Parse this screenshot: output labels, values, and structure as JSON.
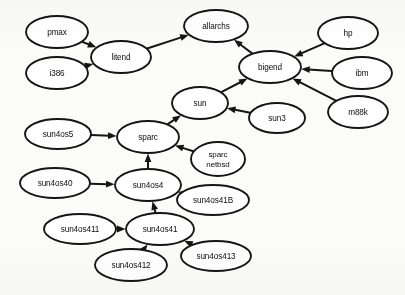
{
  "diagram": {
    "type": "directed-graph",
    "background_color": "#fbfbfa",
    "node_fill": "#ffffff",
    "node_stroke": "#151515",
    "edge_color": "#151515",
    "nodes": [
      {
        "id": "pmax",
        "label": "pmax",
        "cx": 57,
        "cy": 32,
        "rx": 31,
        "ry": 16
      },
      {
        "id": "i386",
        "label": "i386",
        "cx": 57,
        "cy": 73,
        "rx": 31,
        "ry": 16
      },
      {
        "id": "litend",
        "label": "litend",
        "cx": 121,
        "cy": 57,
        "rx": 30,
        "ry": 16
      },
      {
        "id": "allarchs",
        "label": "allarchs",
        "cx": 216,
        "cy": 26,
        "rx": 32,
        "ry": 16
      },
      {
        "id": "bigend",
        "label": "bigend",
        "cx": 270,
        "cy": 67,
        "rx": 31,
        "ry": 16
      },
      {
        "id": "hp",
        "label": "hp",
        "cx": 348,
        "cy": 33,
        "rx": 30,
        "ry": 16
      },
      {
        "id": "ibm",
        "label": "ibm",
        "cx": 362,
        "cy": 73,
        "rx": 30,
        "ry": 16
      },
      {
        "id": "m88k",
        "label": "m88k",
        "cx": 358,
        "cy": 112,
        "rx": 30,
        "ry": 16
      },
      {
        "id": "sun",
        "label": "sun",
        "cx": 200,
        "cy": 103,
        "rx": 28,
        "ry": 16
      },
      {
        "id": "sun3",
        "label": "sun3",
        "cx": 277,
        "cy": 118,
        "rx": 28,
        "ry": 15
      },
      {
        "id": "sparc",
        "label": "sparc",
        "cx": 148,
        "cy": 137,
        "rx": 31,
        "ry": 16
      },
      {
        "id": "sun4os5",
        "label": "sun4os5",
        "cx": 58,
        "cy": 134,
        "rx": 33,
        "ry": 15
      },
      {
        "id": "sparcnetbsd",
        "label": "sparc\nnetbsd",
        "cx": 218,
        "cy": 159,
        "rx": 27,
        "ry": 17
      },
      {
        "id": "sun4os4",
        "label": "sun4os4",
        "cx": 148,
        "cy": 185,
        "rx": 33,
        "ry": 16
      },
      {
        "id": "sun4os40",
        "label": "sun4os40",
        "cx": 55,
        "cy": 183,
        "rx": 35,
        "ry": 15
      },
      {
        "id": "sun4os41B",
        "label": "sun4os41B",
        "cx": 213,
        "cy": 200,
        "rx": 36,
        "ry": 15
      },
      {
        "id": "sun4os41",
        "label": "sun4os41",
        "cx": 160,
        "cy": 229,
        "rx": 34,
        "ry": 16
      },
      {
        "id": "sun4os411",
        "label": "sun4os411",
        "cx": 80,
        "cy": 229,
        "rx": 36,
        "ry": 15
      },
      {
        "id": "sun4os412",
        "label": "sun4os412",
        "cx": 131,
        "cy": 265,
        "rx": 36,
        "ry": 16
      },
      {
        "id": "sun4os413",
        "label": "sun4os413",
        "cx": 216,
        "cy": 256,
        "rx": 35,
        "ry": 15
      }
    ],
    "edges": [
      {
        "from": "pmax",
        "to": "litend"
      },
      {
        "from": "i386",
        "to": "litend"
      },
      {
        "from": "litend",
        "to": "allarchs"
      },
      {
        "from": "bigend",
        "to": "allarchs"
      },
      {
        "from": "hp",
        "to": "bigend"
      },
      {
        "from": "ibm",
        "to": "bigend"
      },
      {
        "from": "m88k",
        "to": "bigend"
      },
      {
        "from": "sun",
        "to": "bigend"
      },
      {
        "from": "sun3",
        "to": "sun"
      },
      {
        "from": "sparc",
        "to": "sun"
      },
      {
        "from": "sun4os5",
        "to": "sparc"
      },
      {
        "from": "sparcnetbsd",
        "to": "sparc"
      },
      {
        "from": "sun4os4",
        "to": "sparc"
      },
      {
        "from": "sun4os40",
        "to": "sun4os4"
      },
      {
        "from": "sun4os41B",
        "to": "sun4os4"
      },
      {
        "from": "sun4os41",
        "to": "sun4os4"
      },
      {
        "from": "sun4os411",
        "to": "sun4os41"
      },
      {
        "from": "sun4os412",
        "to": "sun4os41"
      },
      {
        "from": "sun4os413",
        "to": "sun4os41"
      }
    ]
  }
}
